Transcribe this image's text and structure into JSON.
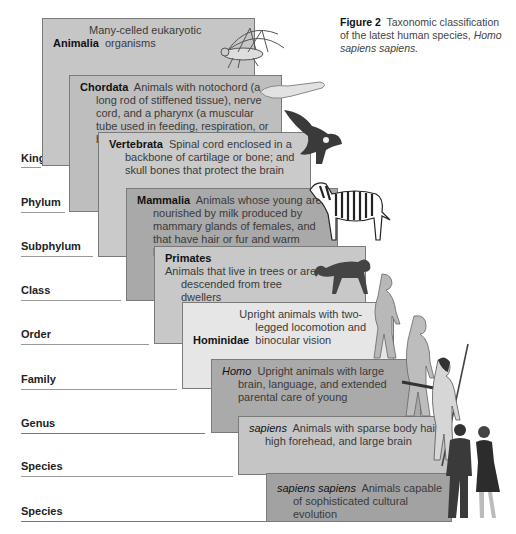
{
  "figure": {
    "caption_label": "Figure 2",
    "caption_text": "Taxonomic classification of the latest human species,",
    "caption_species": "Homo sapiens sapiens."
  },
  "ranks": [
    {
      "label": "Kingdom"
    },
    {
      "label": "Phylum"
    },
    {
      "label": "Subphylum"
    },
    {
      "label": "Class"
    },
    {
      "label": "Order"
    },
    {
      "label": "Family"
    },
    {
      "label": "Genus"
    },
    {
      "label": "Species"
    },
    {
      "label": "Species"
    }
  ],
  "taxa": [
    {
      "name": "Animalia",
      "desc": "Many-celled eukaryotic organisms",
      "illustration": "grasshopper",
      "color": "#c6c6c6"
    },
    {
      "name": "Chordata",
      "desc": "Animals with notochord (a long rod of stiffened tissue), nerve cord, and a pharynx (a muscular tube used in feeding, respiration, or both)",
      "illustration": "lancelet",
      "color": "#bebebe"
    },
    {
      "name": "Vertebrata",
      "desc": "Spinal cord enclosed in a backbone of cartilage or bone; and skull bones that protect the brain",
      "illustration": "eagle",
      "color": "#cacaca"
    },
    {
      "name": "Mammalia",
      "desc": "Animals whose young are nourished by milk produced by mammary glands of females, and that have hair or fur and warm blood",
      "illustration": "zebra",
      "color": "#a9a9a9"
    },
    {
      "name": "Primates",
      "desc": "Animals that live in trees or are descended from tree dwellers",
      "illustration": "monkey",
      "color": "#c8c8c8"
    },
    {
      "name": "Hominidae",
      "desc": "Upright animals with two-legged locomotion and binocular vision",
      "illustration": "early-hominid",
      "color": "#e6e6e6"
    },
    {
      "name": "Homo",
      "desc": "Upright animals with large brain, language, and extended parental care of young",
      "illustration": "early-human",
      "color": "#aaaaaa"
    },
    {
      "name": "sapiens",
      "desc": "Animals with sparse body hair, high forehead, and large brain",
      "illustration": "caveman-with-spear",
      "color": "#c5c5c5"
    },
    {
      "name": "sapiens sapiens",
      "desc": "Animals capable of sophisticated cultural evolution",
      "illustration": "modern-humans",
      "color": "#a2a2a2"
    }
  ]
}
